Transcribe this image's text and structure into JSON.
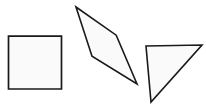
{
  "canvas": {
    "width": 206,
    "height": 108,
    "background_color": "#ffffff",
    "title": "Geometric Shapes"
  },
  "style": {
    "stroke_color": "#1a1a1a",
    "fill_color": "#fafafa",
    "stroke_width": 1.6
  },
  "shapes": [
    {
      "name": "square",
      "label": "Square",
      "points": "8.5,36.2 61.5,36.2 61.5,89.0 8.5,89.0",
      "stroke": "#1a1a1a",
      "fill": "#fafafa",
      "stroke_width": 1.7,
      "vertices": [
        [
          8.5,
          36.2
        ],
        [
          61.5,
          36.2
        ],
        [
          61.5,
          89.0
        ],
        [
          8.5,
          89.0
        ]
      ],
      "vertex_count": 4
    },
    {
      "name": "parallelogram",
      "label": "Parallelogram",
      "points": "76.0,7.0 116.2,35.2 137.0,84.0 92.0,56.2",
      "stroke": "#1a1a1a",
      "fill": "#fafafa",
      "stroke_width": 1.6,
      "vertices": [
        [
          76.0,
          7.0
        ],
        [
          116.2,
          35.2
        ],
        [
          137.0,
          84.0
        ],
        [
          92.0,
          56.2
        ]
      ],
      "vertex_count": 4
    },
    {
      "name": "right-triangle",
      "label": "Triangle",
      "points": "146.0,46.0 202.0,45.0 151.0,102.0",
      "stroke": "#1a1a1a",
      "fill": "#fafafa",
      "stroke_width": 1.6,
      "vertices": [
        [
          146.0,
          46.0
        ],
        [
          202.0,
          45.0
        ],
        [
          151.0,
          102.0
        ]
      ],
      "vertex_count": 3
    }
  ]
}
